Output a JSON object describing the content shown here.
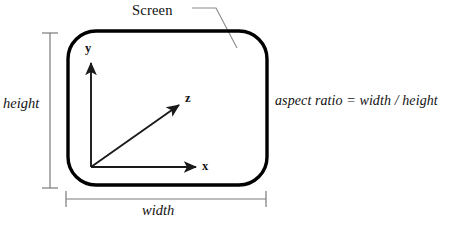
{
  "figure": {
    "title_label": "Screen",
    "caption_formula": "aspect ratio = width / height",
    "dimensions": {
      "height_label": "height",
      "width_label": "width"
    },
    "axes": {
      "x_label": "x",
      "y_label": "y",
      "z_label": "z"
    },
    "colors": {
      "screen_outline": "#000000",
      "axis_line": "#1a1a1a",
      "dimension_line": "#7a7a7a",
      "leader_line": "#8a8a8a",
      "text": "#111111",
      "background": "#ffffff"
    }
  }
}
